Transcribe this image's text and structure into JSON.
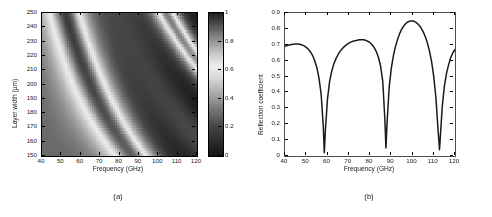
{
  "figure": {
    "panels": [
      {
        "id": "a",
        "caption": "(a)",
        "type": "heatmap",
        "xlabel": "Frequency (GHz)",
        "ylabel": "Layer width (µm)"
      },
      {
        "id": "b",
        "caption": "(b)",
        "type": "line",
        "xlabel": "Frequency (GHz)",
        "ylabel": "Reflection coefficient"
      }
    ]
  },
  "chart_data": [
    {
      "type": "heatmap",
      "title": "",
      "xlabel": "Frequency (GHz)",
      "ylabel": "Layer width (µm)",
      "xlim": [
        40,
        120
      ],
      "ylim": [
        150,
        250
      ],
      "xticks": [
        40,
        50,
        60,
        70,
        80,
        90,
        100,
        110,
        120
      ],
      "yticks": [
        150,
        160,
        170,
        180,
        190,
        200,
        210,
        220,
        230,
        240,
        250
      ],
      "xticklabels": [
        "40",
        "50",
        "60",
        "70",
        "80",
        "90",
        "100",
        "110",
        "120"
      ],
      "yticklabels": [
        "150",
        "160",
        "170",
        "180",
        "190",
        "200",
        "210",
        "220",
        "230",
        "240",
        "250"
      ],
      "grid": false,
      "colorbar": {
        "label": "",
        "vmin": 0,
        "vmax": 1,
        "ticks": [
          0,
          0.2,
          0.4,
          0.6,
          0.8,
          1
        ],
        "ticklabels": [
          "0",
          "0.2",
          "0.4",
          "0.6",
          "0.8",
          "1"
        ],
        "colormap": "bone-inverted-nonmonotonic",
        "stops": [
          {
            "value": 0.0,
            "hex": "#141414"
          },
          {
            "value": 0.12,
            "hex": "#303030"
          },
          {
            "value": 0.22,
            "hex": "#4a4a4a"
          },
          {
            "value": 0.34,
            "hex": "#7d7d7d"
          },
          {
            "value": 0.46,
            "hex": "#b4b4b4"
          },
          {
            "value": 0.56,
            "hex": "#dedede"
          },
          {
            "value": 0.63,
            "hex": "#ededed"
          },
          {
            "value": 0.72,
            "hex": "#c6c6c6"
          },
          {
            "value": 0.82,
            "hex": "#8a8a8a"
          },
          {
            "value": 0.9,
            "hex": "#5a5a5a"
          },
          {
            "value": 1.0,
            "hex": "#1e1e1e"
          }
        ]
      },
      "description": "Reflection coefficient map versus frequency and layer width; diagonal resonance fringes slope downward to the right, becoming narrower and more densely packed at higher frequency.",
      "nx": 81,
      "ny": 51,
      "model": {
        "background": 0.62,
        "fringe_order_count": 7,
        "fringe_slope_note": "resonance order m satisfies f*w approximately constant"
      }
    },
    {
      "type": "line",
      "title": "",
      "xlabel": "Frequency (GHz)",
      "ylabel": "Reflection coefficient",
      "xlim": [
        40,
        120
      ],
      "ylim": [
        0,
        0.9
      ],
      "xticks": [
        40,
        50,
        60,
        70,
        80,
        90,
        100,
        110,
        120
      ],
      "yticks": [
        0,
        0.1,
        0.2,
        0.3,
        0.4,
        0.5,
        0.6,
        0.7,
        0.8,
        0.9
      ],
      "xticklabels": [
        "40",
        "50",
        "60",
        "70",
        "80",
        "90",
        "100",
        "110",
        "120"
      ],
      "yticklabels": [
        "0",
        "0.1",
        "0.2",
        "0.3",
        "0.4",
        "0.5",
        "0.6",
        "0.7",
        "0.8",
        "0.9"
      ],
      "grid": false,
      "legend": null,
      "series": [
        {
          "name": "Reflection coefficient",
          "color": "#1a1a1a",
          "linewidth": 1.6,
          "x": [
            40,
            41,
            42,
            43,
            44,
            45,
            46,
            47,
            48,
            49,
            50,
            51,
            52,
            53,
            54,
            55,
            56,
            57,
            58,
            58.5,
            59,
            60,
            61,
            62,
            63,
            64,
            65,
            66,
            67,
            68,
            69,
            70,
            71,
            72,
            73,
            74,
            75,
            76,
            77,
            78,
            79,
            80,
            81,
            82,
            83,
            84,
            85,
            86,
            87,
            87.5,
            88,
            89,
            90,
            91,
            92,
            93,
            94,
            95,
            96,
            97,
            98,
            99,
            100,
            101,
            102,
            103,
            104,
            105,
            106,
            107,
            108,
            109,
            110,
            111,
            112,
            112.7,
            113,
            114,
            115,
            116,
            117,
            118,
            119,
            120
          ],
          "y": [
            0.69,
            0.695,
            0.699,
            0.702,
            0.704,
            0.705,
            0.705,
            0.703,
            0.699,
            0.693,
            0.684,
            0.672,
            0.655,
            0.632,
            0.6,
            0.556,
            0.49,
            0.39,
            0.19,
            0.02,
            0.16,
            0.36,
            0.47,
            0.535,
            0.58,
            0.613,
            0.639,
            0.66,
            0.676,
            0.69,
            0.701,
            0.71,
            0.717,
            0.722,
            0.726,
            0.729,
            0.731,
            0.732,
            0.731,
            0.728,
            0.722,
            0.713,
            0.7,
            0.682,
            0.656,
            0.62,
            0.565,
            0.47,
            0.23,
            0.05,
            0.2,
            0.43,
            0.55,
            0.63,
            0.69,
            0.735,
            0.772,
            0.8,
            0.821,
            0.836,
            0.845,
            0.85,
            0.85,
            0.846,
            0.838,
            0.825,
            0.807,
            0.783,
            0.752,
            0.712,
            0.66,
            0.592,
            0.5,
            0.37,
            0.17,
            0.04,
            0.1,
            0.31,
            0.44,
            0.52,
            0.575,
            0.62,
            0.65,
            0.67
          ],
          "minima": [
            {
              "x": 58.5,
              "y": 0.02
            },
            {
              "x": 87.5,
              "y": 0.05
            },
            {
              "x": 112.7,
              "y": 0.04
            }
          ],
          "maxima": [
            {
              "x": 45.5,
              "y": 0.705
            },
            {
              "x": 76.0,
              "y": 0.732
            },
            {
              "x": 99.0,
              "y": 0.85
            }
          ],
          "endpoints": [
            {
              "x": 40,
              "y": 0.69
            },
            {
              "x": 120,
              "y": 0.67
            }
          ]
        }
      ]
    }
  ]
}
